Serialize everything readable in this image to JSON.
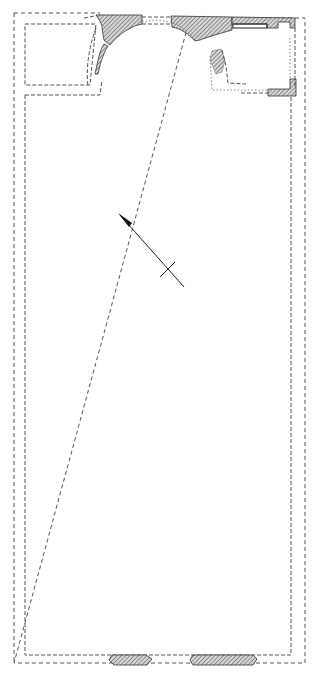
{
  "diagram": {
    "type": "architectural-floor-plan",
    "labels": [],
    "colors": {
      "line": "#555555",
      "wall_fill": "#888888",
      "background": "#ffffff"
    },
    "elements": {
      "outer_wall_outline": "dashed rectangle enclosing the main hall",
      "inner_wall_outline": "dashed rectangle inside the outer outline",
      "left_annex": "rectangular room at top-left",
      "apse": "semicircular apse at top-center",
      "right_annex": "room at top-right with hatched wall remains",
      "north_arrow": "arrow pointing to upper-left with cross bar",
      "bottom_wall_remains": [
        "hatched wall fragment left",
        "hatched wall fragment right"
      ]
    }
  }
}
